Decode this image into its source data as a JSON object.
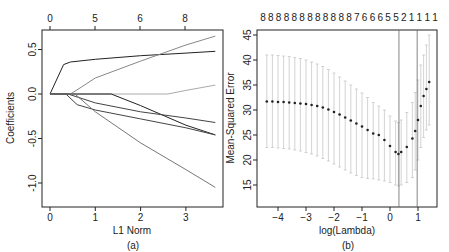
{
  "chart_data": [
    {
      "panel": "a",
      "type": "line",
      "caption": "(a)",
      "xlabel": "L1 Norm",
      "ylabel": "Coefficients",
      "xticks": [
        "0",
        "1",
        "2",
        "3"
      ],
      "yticks": [
        "-1.0",
        "-0.5",
        "0.0",
        "0.5"
      ],
      "top_axis_ticks": [
        "0",
        "5",
        "6",
        "8"
      ],
      "xlim": [
        0,
        3.7
      ],
      "ylim": [
        -1.1,
        0.7
      ],
      "grid": false,
      "series": [
        {
          "name": "coef1",
          "color": "#222222",
          "x": [
            0,
            0.3,
            0.45,
            1,
            2,
            3,
            3.65
          ],
          "y": [
            0,
            0.33,
            0.36,
            0.39,
            0.43,
            0.46,
            0.48
          ]
        },
        {
          "name": "coef2",
          "color": "#888888",
          "x": [
            0,
            0.45,
            0.7,
            1,
            2,
            3,
            3.65
          ],
          "y": [
            0,
            0,
            0.08,
            0.18,
            0.37,
            0.55,
            0.65
          ]
        },
        {
          "name": "coef3",
          "color": "#aaaaaa",
          "x": [
            0,
            2.6,
            3,
            3.65
          ],
          "y": [
            0,
            0,
            0.04,
            0.1
          ]
        },
        {
          "name": "coef4",
          "color": "#222222",
          "x": [
            0,
            1.35,
            2,
            3,
            3.65
          ],
          "y": [
            0,
            0,
            -0.13,
            -0.35,
            -0.46
          ]
        },
        {
          "name": "coef5",
          "color": "#444444",
          "x": [
            0,
            0.4,
            1,
            2,
            3,
            3.65
          ],
          "y": [
            0,
            0,
            -0.1,
            -0.2,
            -0.27,
            -0.32
          ]
        },
        {
          "name": "coef6",
          "color": "#444444",
          "x": [
            0,
            0.35,
            0.6,
            1,
            2,
            3,
            3.65
          ],
          "y": [
            0,
            0,
            -0.12,
            -0.18,
            -0.28,
            -0.38,
            -0.46
          ]
        },
        {
          "name": "coef7",
          "color": "#777777",
          "x": [
            0,
            0.55,
            1,
            2,
            3,
            3.65
          ],
          "y": [
            0,
            0,
            -0.2,
            -0.55,
            -0.85,
            -1.05
          ]
        }
      ]
    },
    {
      "panel": "b",
      "type": "scatter",
      "caption": "(b)",
      "xlabel": "log(Lambda)",
      "ylabel": "Mean-Squared Error",
      "xticks": [
        "-4",
        "-3",
        "-2",
        "-1",
        "0",
        "1"
      ],
      "yticks": [
        "15",
        "20",
        "25",
        "30",
        "35",
        "40",
        "45"
      ],
      "top_axis_ticks": [
        "8",
        "8",
        "8",
        "8",
        "8",
        "8",
        "8",
        "8",
        "8",
        "8",
        "8",
        "8",
        "7",
        "6",
        "6",
        "6",
        "5",
        "5",
        "2",
        "1",
        "1",
        "1",
        "1"
      ],
      "xlim": [
        -4.6,
        1.6
      ],
      "ylim": [
        13.5,
        46
      ],
      "vlines": [
        0.32,
        0.97
      ],
      "grid": false,
      "x": [
        -4.4,
        -4.2,
        -4.0,
        -3.8,
        -3.6,
        -3.4,
        -3.2,
        -3.0,
        -2.8,
        -2.6,
        -2.4,
        -2.2,
        -2.0,
        -1.8,
        -1.6,
        -1.4,
        -1.2,
        -1.0,
        -0.8,
        -0.6,
        -0.4,
        -0.2,
        0.0,
        0.2,
        0.3,
        0.4,
        0.6,
        0.8,
        0.9,
        1.0,
        1.1,
        1.2,
        1.3,
        1.4
      ],
      "mse": [
        31.7,
        31.7,
        31.6,
        31.6,
        31.5,
        31.4,
        31.3,
        31.2,
        31.0,
        30.8,
        30.5,
        30.1,
        29.6,
        29.1,
        28.5,
        27.9,
        27.3,
        26.7,
        26.0,
        25.3,
        25.0,
        24.0,
        22.8,
        21.6,
        21.2,
        21.6,
        22.6,
        24.3,
        25.8,
        28.0,
        30.8,
        32.8,
        34.2,
        35.6
      ],
      "upper": [
        41,
        41,
        40.9,
        40.8,
        40.7,
        40.5,
        40.3,
        40,
        39.6,
        39.2,
        38.7,
        38.1,
        37.4,
        36.6,
        35.8,
        35,
        34.2,
        33.4,
        32.5,
        31.5,
        30.8,
        30,
        28.8,
        27.8,
        27.5,
        28,
        29.5,
        31.5,
        33.5,
        36,
        39,
        41,
        43,
        45
      ],
      "lower": [
        22.5,
        22.5,
        22.4,
        22.3,
        22.2,
        22.0,
        21.8,
        21.5,
        21.2,
        20.8,
        20.3,
        19.8,
        19.2,
        18.6,
        18.0,
        17.4,
        16.9,
        16.5,
        16.3,
        16.2,
        16.0,
        15.8,
        15.5,
        15.0,
        14.8,
        15.0,
        15.5,
        16.5,
        18,
        20,
        22.5,
        24.5,
        26,
        27
      ]
    }
  ]
}
